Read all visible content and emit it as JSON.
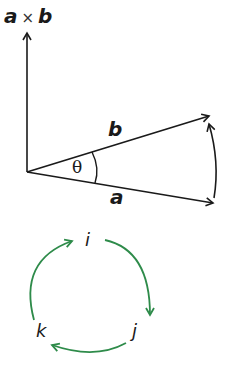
{
  "cross_product_diagram": {
    "axis_label_a": "a",
    "axis_label_times": "×",
    "axis_label_b": "b",
    "vector_b_label": "b",
    "vector_a_label": "a",
    "angle_label": "θ"
  },
  "cycle_diagram": {
    "node_i": "i",
    "node_j": "j",
    "node_k": "k"
  },
  "colors": {
    "ink": "#1a1a1a",
    "cycle": "#2e8b4a"
  }
}
